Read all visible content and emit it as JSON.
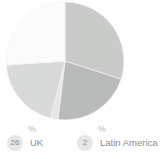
{
  "chart_data": {
    "type": "pie",
    "title": "",
    "subtitle": "",
    "xlabel": "",
    "ylabel": "",
    "legend_position": "bottom",
    "grid": false,
    "unit": "%",
    "categories": [
      "UK",
      "Latin America",
      "Other 1",
      "Other 2",
      "Other 3"
    ],
    "values": [
      26,
      2,
      30,
      22,
      20
    ],
    "slices": [
      {
        "label": "Other 1",
        "value": 30,
        "color": "#c9cbc9",
        "start_angle": 0,
        "end_angle": 108
      },
      {
        "label": "Other 2",
        "value": 22,
        "color": "#b9bbba",
        "start_angle": 108,
        "end_angle": 187
      },
      {
        "label": "Latin America",
        "value": 2,
        "color": "#e4e6e5",
        "start_angle": 187,
        "end_angle": 194
      },
      {
        "label": "Other 3",
        "value": 20,
        "color": "#d8dad9",
        "start_angle": 194,
        "end_angle": 266
      },
      {
        "label": "UK",
        "value": 26,
        "color": "#fbfbfb",
        "start_angle": 266,
        "end_angle": 360
      }
    ]
  },
  "pie": {
    "center_x": 65,
    "center_y": 61,
    "radius": 59
  },
  "legend": {
    "items": [
      {
        "badge": "26",
        "percent_symbol": "%",
        "label": "UK"
      },
      {
        "badge": "2",
        "percent_symbol": "%",
        "label": "Latin America"
      }
    ]
  },
  "colors": {
    "background": "#fefefe",
    "badge_background": "#e6e6e6",
    "badge_text": "#8e8e8e",
    "label_text": "#8e8e8e",
    "percent_text": "#b9b9b9",
    "slice_dark": "#b9bbba",
    "slice_mid": "#c9cbc9",
    "slice_light": "#d8dad9",
    "slice_faint": "#e4e6e5",
    "slice_white": "#fbfbfb"
  }
}
